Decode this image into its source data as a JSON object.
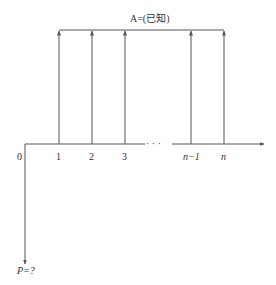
{
  "diagram": {
    "type": "cash-flow-timeline",
    "annuity_label": "A=(已知)",
    "present_value_label": "P=?",
    "origin_label": "0",
    "ellipsis": "· · ·",
    "periods": [
      {
        "label": "1",
        "x": 59
      },
      {
        "label": "2",
        "x": 92
      },
      {
        "label": "3",
        "x": 125
      },
      {
        "label": "n−1",
        "x": 191
      },
      {
        "label": "n",
        "x": 224
      }
    ],
    "colors": {
      "line": "#555555",
      "text": "#333333"
    }
  }
}
